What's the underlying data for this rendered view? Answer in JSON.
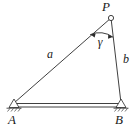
{
  "figure": {
    "kind": "triangle-truss-diagram",
    "background_color": "#ffffff",
    "line_color": "#2a2a2a",
    "width": 139,
    "height": 129,
    "vertices": [
      {
        "id": "P",
        "label": "P",
        "x": 111,
        "y": 18,
        "marker": "open-circle",
        "label_x": 106,
        "label_y": 11
      },
      {
        "id": "A",
        "label": "A",
        "x": 14,
        "y": 103,
        "marker": "pin-support",
        "label_x": 12,
        "label_y": 124
      },
      {
        "id": "B",
        "label": "B",
        "x": 121,
        "y": 103,
        "marker": "pin-support",
        "label_x": 119,
        "label_y": 124
      }
    ],
    "members": [
      {
        "id": "AP",
        "label": "a",
        "from": "A",
        "to": "P",
        "style": "single-line",
        "label_x": 50,
        "label_y": 58
      },
      {
        "id": "PB",
        "label": "b",
        "from": "P",
        "to": "B",
        "style": "single-line",
        "label_x": 126,
        "label_y": 63
      },
      {
        "id": "AB",
        "label": "",
        "from": "A",
        "to": "B",
        "style": "double-line-bar",
        "label_x": 0,
        "label_y": 0
      }
    ],
    "angles": [
      {
        "id": "gamma",
        "label": "γ",
        "at_vertex": "P",
        "marker": "arc-with-arrowheads",
        "label_x": 100,
        "label_y": 46
      }
    ]
  }
}
